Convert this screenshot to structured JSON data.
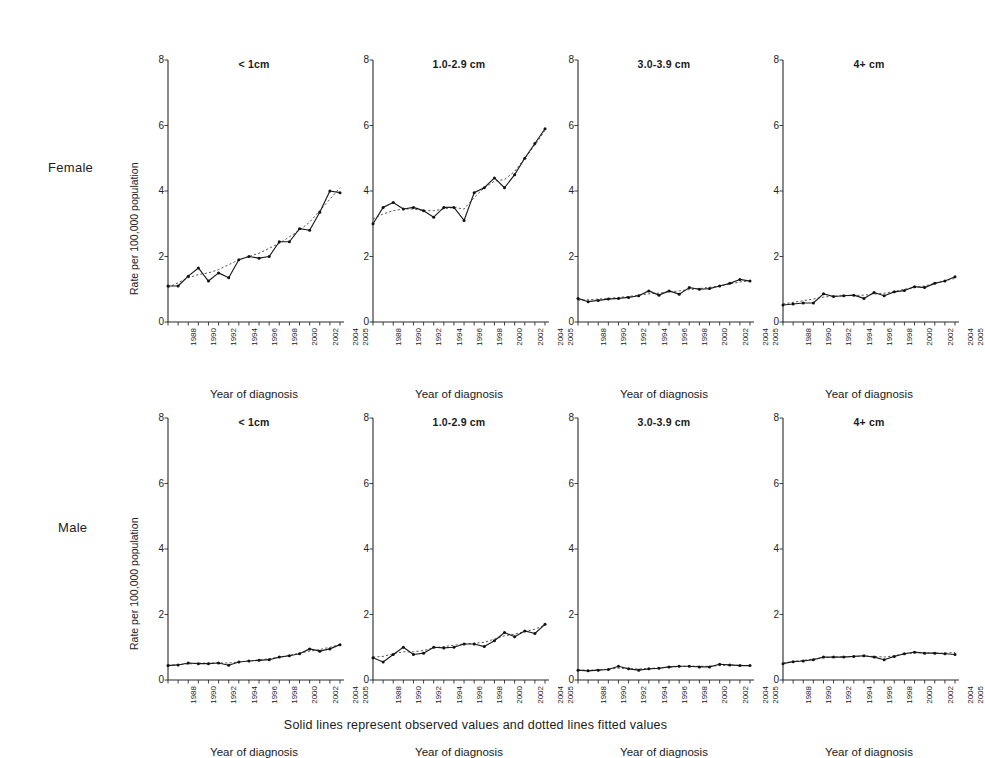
{
  "figure": {
    "caption": "Solid lines represent observed values and dotted lines fitted values",
    "row_labels": [
      "Female",
      "Male"
    ],
    "y_axis_label": "Rate per 100,000 population",
    "x_axis_label": "Year of diagnosis",
    "series_legend": {
      "observed": "Solid lines represent observed values",
      "fitted": "dotted lines fitted values"
    }
  },
  "chart_data": [
    {
      "type": "line",
      "title": "< 1cm",
      "row": "Female",
      "xlabel": "Year of diagnosis",
      "ylabel": "Rate per 100,000 population",
      "ylim": [
        0,
        8
      ],
      "yticks": [
        0,
        2,
        4,
        6,
        8
      ],
      "xlim": [
        1988,
        2005
      ],
      "xticks": [
        1988,
        1990,
        1992,
        1994,
        1996,
        1998,
        2000,
        2002,
        2004,
        2005
      ],
      "x": [
        1988,
        1989,
        1990,
        1991,
        1992,
        1993,
        1994,
        1995,
        1996,
        1997,
        1998,
        1999,
        2000,
        2001,
        2002,
        2003,
        2004,
        2005
      ],
      "series": [
        {
          "name": "Observed",
          "values": [
            1.1,
            1.1,
            1.4,
            1.65,
            1.25,
            1.5,
            1.35,
            1.9,
            2.0,
            1.95,
            2.0,
            2.45,
            2.45,
            2.85,
            2.8,
            3.35,
            4.0,
            3.95,
            4.75
          ]
        },
        {
          "name": "Fitted",
          "values": [
            1.05,
            1.2,
            1.35,
            1.45,
            1.5,
            1.6,
            1.75,
            1.9,
            2.0,
            2.1,
            2.25,
            2.4,
            2.6,
            2.8,
            3.05,
            3.4,
            3.75,
            4.1,
            4.55
          ]
        }
      ]
    },
    {
      "type": "line",
      "title": "1.0-2.9 cm",
      "row": "Female",
      "xlabel": "Year of diagnosis",
      "ylabel": "Rate per 100,000 population",
      "ylim": [
        0,
        8
      ],
      "yticks": [
        0,
        2,
        4,
        6,
        8
      ],
      "xlim": [
        1988,
        2005
      ],
      "xticks": [
        1988,
        1990,
        1992,
        1994,
        1996,
        1998,
        2000,
        2002,
        2004,
        2005
      ],
      "x": [
        1988,
        1989,
        1990,
        1991,
        1992,
        1993,
        1994,
        1995,
        1996,
        1997,
        1998,
        1999,
        2000,
        2001,
        2002,
        2003,
        2004,
        2005
      ],
      "series": [
        {
          "name": "Observed",
          "values": [
            3.0,
            3.5,
            3.65,
            3.45,
            3.5,
            3.4,
            3.2,
            3.5,
            3.5,
            3.1,
            3.95,
            4.1,
            4.4,
            4.1,
            4.5,
            5.0,
            5.45,
            5.9,
            6.45
          ]
        },
        {
          "name": "Fitted",
          "values": [
            3.15,
            3.3,
            3.4,
            3.45,
            3.45,
            3.4,
            3.4,
            3.45,
            3.5,
            3.45,
            3.8,
            4.1,
            4.3,
            4.35,
            4.6,
            5.0,
            5.4,
            5.85,
            6.3
          ]
        }
      ]
    },
    {
      "type": "line",
      "title": "3.0-3.9 cm",
      "row": "Female",
      "xlabel": "Year of diagnosis",
      "ylabel": "Rate per 100,000 population",
      "ylim": [
        0,
        8
      ],
      "yticks": [
        0,
        2,
        4,
        6,
        8
      ],
      "xlim": [
        1988,
        2005
      ],
      "xticks": [
        1988,
        1990,
        1992,
        1994,
        1996,
        1998,
        2000,
        2002,
        2004,
        2005
      ],
      "x": [
        1988,
        1989,
        1990,
        1991,
        1992,
        1993,
        1994,
        1995,
        1996,
        1997,
        1998,
        1999,
        2000,
        2001,
        2002,
        2003,
        2004,
        2005
      ],
      "series": [
        {
          "name": "Observed",
          "values": [
            0.72,
            0.62,
            0.66,
            0.7,
            0.72,
            0.75,
            0.8,
            0.95,
            0.82,
            0.95,
            0.85,
            1.05,
            1.0,
            1.02,
            1.1,
            1.18,
            1.3,
            1.25,
            1.22
          ]
        },
        {
          "name": "Fitted",
          "values": [
            0.66,
            0.68,
            0.7,
            0.72,
            0.75,
            0.78,
            0.82,
            0.86,
            0.88,
            0.92,
            0.95,
            0.99,
            1.02,
            1.06,
            1.1,
            1.16,
            1.22,
            1.26,
            1.28
          ]
        }
      ]
    },
    {
      "type": "line",
      "title": "4+ cm",
      "row": "Female",
      "xlabel": "Year of diagnosis",
      "ylabel": "Rate per 100,000 population",
      "ylim": [
        0,
        8
      ],
      "yticks": [
        0,
        2,
        4,
        6,
        8
      ],
      "xlim": [
        1988,
        2005
      ],
      "xticks": [
        1988,
        1990,
        1992,
        1994,
        1996,
        1998,
        2000,
        2002,
        2004,
        2005
      ],
      "x": [
        1988,
        1989,
        1990,
        1991,
        1992,
        1993,
        1994,
        1995,
        1996,
        1997,
        1998,
        1999,
        2000,
        2001,
        2002,
        2003,
        2004,
        2005
      ],
      "series": [
        {
          "name": "Observed",
          "values": [
            0.52,
            0.55,
            0.58,
            0.58,
            0.86,
            0.78,
            0.8,
            0.82,
            0.72,
            0.9,
            0.8,
            0.92,
            0.96,
            1.08,
            1.05,
            1.18,
            1.25,
            1.38,
            1.4
          ]
        },
        {
          "name": "Fitted",
          "values": [
            0.55,
            0.6,
            0.65,
            0.7,
            0.76,
            0.79,
            0.8,
            0.81,
            0.82,
            0.85,
            0.88,
            0.93,
            1.0,
            1.05,
            1.1,
            1.18,
            1.26,
            1.33,
            1.38
          ]
        }
      ]
    },
    {
      "type": "line",
      "title": "< 1cm",
      "row": "Male",
      "xlabel": "Year of diagnosis",
      "ylabel": "Rate per 100,000 population",
      "ylim": [
        0,
        8
      ],
      "yticks": [
        0,
        2,
        4,
        6,
        8
      ],
      "xlim": [
        1988,
        2005
      ],
      "xticks": [
        1988,
        1990,
        1992,
        1994,
        1996,
        1998,
        2000,
        2002,
        2004,
        2005
      ],
      "x": [
        1988,
        1989,
        1990,
        1991,
        1992,
        1993,
        1994,
        1995,
        1996,
        1997,
        1998,
        1999,
        2000,
        2001,
        2002,
        2003,
        2004,
        2005
      ],
      "series": [
        {
          "name": "Observed",
          "values": [
            0.44,
            0.46,
            0.52,
            0.5,
            0.5,
            0.52,
            0.45,
            0.55,
            0.58,
            0.6,
            0.62,
            0.7,
            0.74,
            0.8,
            0.95,
            0.88,
            0.95,
            1.08,
            1.2
          ]
        },
        {
          "name": "Fitted",
          "values": [
            0.45,
            0.47,
            0.49,
            0.51,
            0.52,
            0.52,
            0.52,
            0.55,
            0.58,
            0.61,
            0.65,
            0.7,
            0.75,
            0.82,
            0.88,
            0.93,
            1.0,
            1.08,
            1.16
          ]
        }
      ]
    },
    {
      "type": "line",
      "title": "1.0-2.9 cm",
      "row": "Male",
      "xlabel": "Year of diagnosis",
      "ylabel": "Rate per 100,000 population",
      "ylim": [
        0,
        8
      ],
      "yticks": [
        0,
        2,
        4,
        6,
        8
      ],
      "xlim": [
        1988,
        2005
      ],
      "xticks": [
        1988,
        1990,
        1992,
        1994,
        1996,
        1998,
        2000,
        2002,
        2004,
        2005
      ],
      "x": [
        1988,
        1989,
        1990,
        1991,
        1992,
        1993,
        1994,
        1995,
        1996,
        1997,
        1998,
        1999,
        2000,
        2001,
        2002,
        2003,
        2004,
        2005
      ],
      "series": [
        {
          "name": "Observed",
          "values": [
            0.68,
            0.55,
            0.78,
            1.0,
            0.78,
            0.82,
            1.0,
            0.98,
            1.0,
            1.1,
            1.1,
            1.02,
            1.2,
            1.45,
            1.32,
            1.5,
            1.42,
            1.7,
            1.82
          ]
        },
        {
          "name": "Fitted",
          "values": [
            0.7,
            0.72,
            0.8,
            0.86,
            0.86,
            0.9,
            0.98,
            1.02,
            1.06,
            1.1,
            1.12,
            1.15,
            1.25,
            1.35,
            1.4,
            1.48,
            1.55,
            1.68,
            1.78
          ]
        }
      ]
    },
    {
      "type": "line",
      "title": "3.0-3.9 cm",
      "row": "Male",
      "xlabel": "Year of diagnosis",
      "ylabel": "Rate per 100,000 population",
      "ylim": [
        0,
        8
      ],
      "yticks": [
        0,
        2,
        4,
        6,
        8
      ],
      "xlim": [
        1988,
        2005
      ],
      "xticks": [
        1988,
        1990,
        1992,
        1994,
        1996,
        1998,
        2000,
        2002,
        2004,
        2005
      ],
      "x": [
        1988,
        1989,
        1990,
        1991,
        1992,
        1993,
        1994,
        1995,
        1996,
        1997,
        1998,
        1999,
        2000,
        2001,
        2002,
        2003,
        2004,
        2005
      ],
      "series": [
        {
          "name": "Observed",
          "values": [
            0.3,
            0.28,
            0.3,
            0.32,
            0.42,
            0.34,
            0.3,
            0.34,
            0.36,
            0.4,
            0.42,
            0.42,
            0.4,
            0.4,
            0.48,
            0.46,
            0.44,
            0.44,
            0.44
          ]
        },
        {
          "name": "Fitted",
          "values": [
            0.3,
            0.3,
            0.31,
            0.33,
            0.36,
            0.35,
            0.34,
            0.35,
            0.37,
            0.39,
            0.41,
            0.42,
            0.42,
            0.42,
            0.44,
            0.45,
            0.45,
            0.44,
            0.44
          ]
        }
      ]
    },
    {
      "type": "line",
      "title": "4+ cm",
      "row": "Male",
      "xlabel": "Year of diagnosis",
      "ylabel": "Rate per 100,000 population",
      "ylim": [
        0,
        8
      ],
      "yticks": [
        0,
        2,
        4,
        6,
        8
      ],
      "xlim": [
        1988,
        2005
      ],
      "xticks": [
        1988,
        1990,
        1992,
        1994,
        1996,
        1998,
        2000,
        2002,
        2004,
        2005
      ],
      "x": [
        1988,
        1989,
        1990,
        1991,
        1992,
        1993,
        1994,
        1995,
        1996,
        1997,
        1998,
        1999,
        2000,
        2001,
        2002,
        2003,
        2004,
        2005
      ],
      "series": [
        {
          "name": "Observed",
          "values": [
            0.5,
            0.56,
            0.58,
            0.62,
            0.7,
            0.7,
            0.7,
            0.72,
            0.74,
            0.7,
            0.62,
            0.72,
            0.8,
            0.85,
            0.82,
            0.82,
            0.8,
            0.78,
            1.02
          ]
        },
        {
          "name": "Fitted",
          "values": [
            0.52,
            0.56,
            0.6,
            0.64,
            0.68,
            0.7,
            0.71,
            0.72,
            0.73,
            0.72,
            0.7,
            0.74,
            0.8,
            0.83,
            0.83,
            0.82,
            0.82,
            0.84,
            0.94
          ]
        }
      ]
    }
  ]
}
